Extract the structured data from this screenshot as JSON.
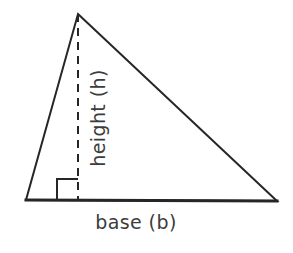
{
  "figure": {
    "type": "geometry-diagram",
    "background_color": "#ffffff",
    "stroke_color": "#262626",
    "text_color": "#3c3c3c",
    "stroke_width": 2,
    "canvas": {
      "width": 293,
      "height": 253
    }
  },
  "labels": {
    "base": "base (b)",
    "height": "height (h)"
  },
  "shape": {
    "name": "triangle",
    "vertices": {
      "apex": {
        "x": 78,
        "y": 14
      },
      "bottom_left": {
        "x": 26,
        "y": 200
      },
      "bottom_right": {
        "x": 277,
        "y": 201
      }
    },
    "altitude": {
      "name": "height-dashed-line",
      "from": {
        "x": 78,
        "y": 14
      },
      "to": {
        "x": 78,
        "y": 200
      },
      "style": "dashed",
      "dash_length": 8,
      "gap_length": 6
    },
    "right_angle_marker": {
      "name": "right-angle-square",
      "x": 57,
      "y": 179,
      "size": 21
    }
  },
  "label_positions": {
    "base": {
      "x": 136,
      "y": 229,
      "rotation": 0
    },
    "height": {
      "x": 105,
      "y": 118,
      "rotation": -90
    }
  }
}
